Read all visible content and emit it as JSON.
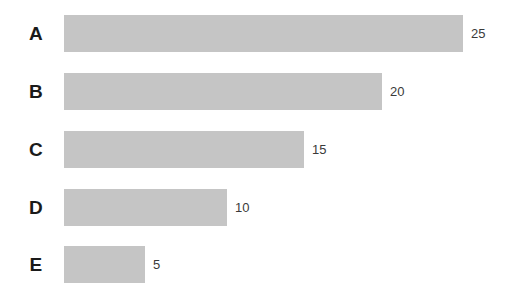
{
  "chart_data": {
    "type": "bar",
    "orientation": "horizontal",
    "title": "",
    "subtitle": "",
    "xlabel": "",
    "ylabel": "",
    "categories": [
      "A",
      "B",
      "C",
      "D",
      "E"
    ],
    "values": [
      25,
      20,
      15,
      10,
      5
    ],
    "value_labels": [
      "25",
      "20",
      "15",
      "10",
      "5"
    ],
    "xlim": [
      0,
      25
    ],
    "grid": false,
    "legend": null,
    "axes_visible": false,
    "bars": [
      {
        "category": "A",
        "value": 25,
        "label": "25",
        "width_px": 399,
        "top_px": 15
      },
      {
        "category": "B",
        "value": 20,
        "label": "20",
        "width_px": 318,
        "top_px": 73
      },
      {
        "category": "C",
        "value": 15,
        "label": "15",
        "width_px": 240,
        "top_px": 131
      },
      {
        "category": "D",
        "value": 10,
        "label": "10",
        "width_px": 163,
        "top_px": 189
      },
      {
        "category": "E",
        "value": 5,
        "label": "5",
        "width_px": 81,
        "top_px": 246
      }
    ]
  },
  "style": {
    "bar_color": "#c5c5c5",
    "background_color": "#ffffff",
    "category_label_color": "#1a1a1a",
    "value_label_color": "#3a3a3a"
  }
}
